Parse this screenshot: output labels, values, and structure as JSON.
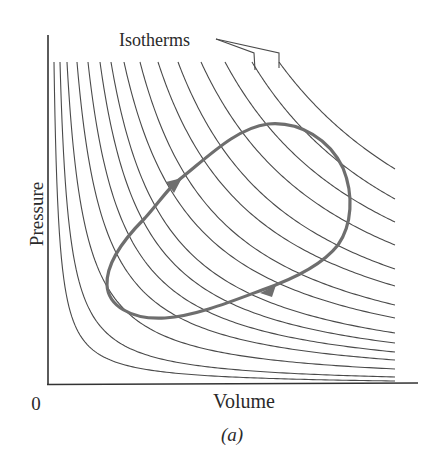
{
  "chart_data": {
    "type": "line",
    "title": "",
    "subtitle": "",
    "xlabel": "Volume",
    "ylabel": "Pressure",
    "origin_label": "0",
    "caption": "(a)",
    "annotation": "Isotherms",
    "grid": false,
    "legend": "none",
    "isotherms": {
      "count": 15,
      "start_top_x_px": [
        54,
        60,
        67,
        77,
        88,
        100,
        111,
        124,
        140,
        158,
        178,
        201,
        225,
        252,
        279
      ],
      "end_right_y_px": [
        381,
        377,
        369,
        360,
        352,
        343,
        333,
        318,
        305,
        286,
        269,
        245,
        222,
        199,
        169
      ]
    },
    "cycle": {
      "direction": "clockwise",
      "points_px": [
        [
          107,
          285
        ],
        [
          120,
          235
        ],
        [
          175,
          183
        ],
        [
          265,
          124
        ],
        [
          330,
          160
        ],
        [
          350,
          215
        ],
        [
          330,
          255
        ],
        [
          270,
          288
        ],
        [
          175,
          318
        ],
        [
          110,
          305
        ]
      ],
      "arrows": [
        {
          "at_px": [
            175,
            184
          ],
          "direction": "up-right"
        },
        {
          "at_px": [
            268,
            289
          ],
          "direction": "down-left"
        }
      ]
    }
  },
  "colors": {
    "isotherm": "#4a4a4a",
    "cycle": "#6e6e6e",
    "axis": "#333333",
    "text": "#2a2a2a"
  }
}
